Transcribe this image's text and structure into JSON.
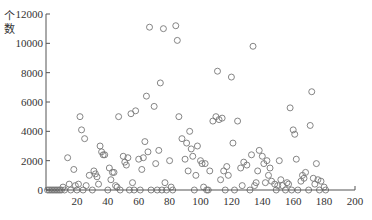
{
  "chart_data": {
    "type": "scatter",
    "title": "",
    "xlabel": "",
    "ylabel": "个数",
    "xlim": [
      0,
      200
    ],
    "ylim": [
      0,
      12000
    ],
    "x_ticks": [
      20,
      40,
      60,
      80,
      100,
      120,
      140,
      160,
      180,
      200
    ],
    "y_ticks": [
      0,
      2000,
      4000,
      6000,
      8000,
      10000,
      12000
    ],
    "grid": false,
    "marker": "hollow-circle",
    "marker_color": "#777777",
    "series": [
      {
        "name": "points",
        "points": [
          [
            1,
            0
          ],
          [
            2,
            0
          ],
          [
            3,
            0
          ],
          [
            4,
            0
          ],
          [
            5,
            0
          ],
          [
            6,
            0
          ],
          [
            7,
            0
          ],
          [
            8,
            0
          ],
          [
            9,
            0
          ],
          [
            10,
            0
          ],
          [
            11,
            200
          ],
          [
            12,
            0
          ],
          [
            14,
            2200
          ],
          [
            15,
            400
          ],
          [
            16,
            0
          ],
          [
            18,
            1400
          ],
          [
            19,
            300
          ],
          [
            20,
            0
          ],
          [
            21,
            400
          ],
          [
            22,
            5000
          ],
          [
            23,
            4100
          ],
          [
            24,
            0
          ],
          [
            25,
            3500
          ],
          [
            26,
            300
          ],
          [
            28,
            1000
          ],
          [
            30,
            0
          ],
          [
            31,
            1300
          ],
          [
            32,
            1100
          ],
          [
            33,
            900
          ],
          [
            34,
            400
          ],
          [
            35,
            3000
          ],
          [
            36,
            2600
          ],
          [
            37,
            2400
          ],
          [
            38,
            2400
          ],
          [
            40,
            0
          ],
          [
            41,
            1500
          ],
          [
            42,
            700
          ],
          [
            43,
            1200
          ],
          [
            44,
            1200
          ],
          [
            45,
            300
          ],
          [
            46,
            200
          ],
          [
            47,
            5000
          ],
          [
            48,
            0
          ],
          [
            50,
            2300
          ],
          [
            51,
            1900
          ],
          [
            52,
            1700
          ],
          [
            53,
            2200
          ],
          [
            54,
            0
          ],
          [
            55,
            5200
          ],
          [
            56,
            500
          ],
          [
            57,
            0
          ],
          [
            58,
            5400
          ],
          [
            60,
            2100
          ],
          [
            61,
            0
          ],
          [
            62,
            1400
          ],
          [
            63,
            2200
          ],
          [
            64,
            3300
          ],
          [
            65,
            6400
          ],
          [
            66,
            2600
          ],
          [
            67,
            11100
          ],
          [
            68,
            0
          ],
          [
            70,
            5700
          ],
          [
            71,
            1800
          ],
          [
            72,
            0
          ],
          [
            73,
            2700
          ],
          [
            74,
            7300
          ],
          [
            75,
            0
          ],
          [
            76,
            11000
          ],
          [
            77,
            500
          ],
          [
            78,
            0
          ],
          [
            80,
            2000
          ],
          [
            81,
            200
          ],
          [
            82,
            0
          ],
          [
            84,
            11200
          ],
          [
            85,
            10200
          ],
          [
            86,
            5000
          ],
          [
            88,
            3500
          ],
          [
            90,
            2100
          ],
          [
            91,
            3200
          ],
          [
            92,
            1300
          ],
          [
            93,
            4000
          ],
          [
            94,
            2800
          ],
          [
            95,
            2300
          ],
          [
            96,
            0
          ],
          [
            97,
            1000
          ],
          [
            98,
            3000
          ],
          [
            100,
            2000
          ],
          [
            101,
            1800
          ],
          [
            102,
            200
          ],
          [
            103,
            1800
          ],
          [
            104,
            0
          ],
          [
            105,
            0
          ],
          [
            106,
            1300
          ],
          [
            108,
            4700
          ],
          [
            110,
            5000
          ],
          [
            111,
            8100
          ],
          [
            112,
            4800
          ],
          [
            113,
            700
          ],
          [
            114,
            4900
          ],
          [
            115,
            1300
          ],
          [
            116,
            0
          ],
          [
            117,
            1600
          ],
          [
            118,
            1000
          ],
          [
            120,
            7700
          ],
          [
            121,
            3200
          ],
          [
            122,
            0
          ],
          [
            124,
            4700
          ],
          [
            126,
            1500
          ],
          [
            127,
            300
          ],
          [
            128,
            1900
          ],
          [
            130,
            1700
          ],
          [
            132,
            0
          ],
          [
            133,
            2400
          ],
          [
            134,
            9800
          ],
          [
            135,
            300
          ],
          [
            136,
            500
          ],
          [
            137,
            1300
          ],
          [
            138,
            2700
          ],
          [
            140,
            2300
          ],
          [
            141,
            1800
          ],
          [
            142,
            500
          ],
          [
            143,
            2000
          ],
          [
            144,
            1000
          ],
          [
            145,
            1500
          ],
          [
            146,
            600
          ],
          [
            148,
            400
          ],
          [
            149,
            0
          ],
          [
            150,
            300
          ],
          [
            151,
            2000
          ],
          [
            152,
            700
          ],
          [
            153,
            300
          ],
          [
            155,
            0
          ],
          [
            156,
            500
          ],
          [
            157,
            400
          ],
          [
            158,
            5600
          ],
          [
            159,
            0
          ],
          [
            160,
            4100
          ],
          [
            161,
            3800
          ],
          [
            162,
            2100
          ],
          [
            163,
            0
          ],
          [
            165,
            600
          ],
          [
            166,
            1000
          ],
          [
            167,
            800
          ],
          [
            168,
            1200
          ],
          [
            170,
            0
          ],
          [
            171,
            4400
          ],
          [
            172,
            6700
          ],
          [
            173,
            800
          ],
          [
            174,
            400
          ],
          [
            175,
            1800
          ],
          [
            176,
            700
          ],
          [
            177,
            0
          ],
          [
            178,
            600
          ],
          [
            180,
            200
          ],
          [
            181,
            0
          ]
        ]
      }
    ]
  }
}
